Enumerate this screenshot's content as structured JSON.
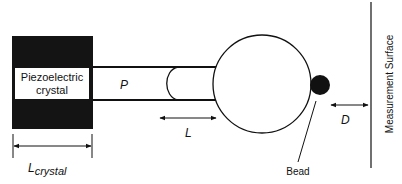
{
  "diagram": {
    "title": "",
    "type": "schematic",
    "colors": {
      "ink": "#111111",
      "background": "#ffffff",
      "crystal_fill": "#141414"
    },
    "components": {
      "crystal": {
        "label_line1": "Piezoelectric",
        "label_line2": "crystal"
      },
      "tube": {
        "label": "P"
      },
      "sphere": {
        "label": ""
      },
      "bead": {
        "label": "Bead"
      },
      "surface": {
        "label": "Measurement Surface"
      }
    },
    "dimensions": {
      "crystal_length": {
        "label_main": "L",
        "label_sub": "crystal"
      },
      "length": {
        "label": "L"
      },
      "distance": {
        "label": "D"
      }
    }
  }
}
